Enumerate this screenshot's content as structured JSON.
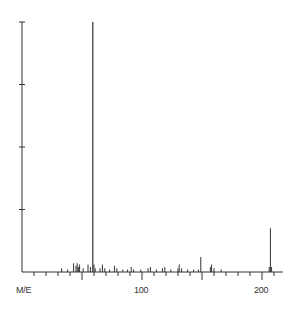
{
  "chart_data": {
    "type": "bar",
    "title": "",
    "xlabel": "M/E",
    "ylabel": "",
    "xlim": [
      0,
      215
    ],
    "ylim": [
      0,
      100
    ],
    "x_ticks": [
      100,
      200
    ],
    "x_tick_labels": [
      "100",
      "200"
    ],
    "y_ticks": [
      25,
      50,
      75,
      100
    ],
    "y_tick_labels": [],
    "grid": false,
    "legend": null,
    "peaks": [
      {
        "mz": 33,
        "intensity": 1.5
      },
      {
        "mz": 38,
        "intensity": 1.0
      },
      {
        "mz": 43,
        "intensity": 3.5
      },
      {
        "mz": 45,
        "intensity": 2.5
      },
      {
        "mz": 46,
        "intensity": 3.5
      },
      {
        "mz": 47,
        "intensity": 2.0
      },
      {
        "mz": 48,
        "intensity": 3.0
      },
      {
        "mz": 51,
        "intensity": 1.5
      },
      {
        "mz": 55,
        "intensity": 3.0
      },
      {
        "mz": 57,
        "intensity": 2.0
      },
      {
        "mz": 59,
        "intensity": 100.0
      },
      {
        "mz": 60,
        "intensity": 3.0
      },
      {
        "mz": 61,
        "intensity": 1.5
      },
      {
        "mz": 65,
        "intensity": 1.5
      },
      {
        "mz": 67,
        "intensity": 3.0
      },
      {
        "mz": 69,
        "intensity": 1.5
      },
      {
        "mz": 73,
        "intensity": 1.0
      },
      {
        "mz": 77,
        "intensity": 2.5
      },
      {
        "mz": 79,
        "intensity": 1.5
      },
      {
        "mz": 84,
        "intensity": 1.0
      },
      {
        "mz": 88,
        "intensity": 1.0
      },
      {
        "mz": 91,
        "intensity": 2.0
      },
      {
        "mz": 93,
        "intensity": 1.0
      },
      {
        "mz": 99,
        "intensity": 1.0
      },
      {
        "mz": 105,
        "intensity": 1.5
      },
      {
        "mz": 107,
        "intensity": 2.0
      },
      {
        "mz": 112,
        "intensity": 1.0
      },
      {
        "mz": 117,
        "intensity": 1.5
      },
      {
        "mz": 119,
        "intensity": 2.0
      },
      {
        "mz": 124,
        "intensity": 1.0
      },
      {
        "mz": 130,
        "intensity": 1.5
      },
      {
        "mz": 131,
        "intensity": 3.0
      },
      {
        "mz": 133,
        "intensity": 1.5
      },
      {
        "mz": 138,
        "intensity": 1.0
      },
      {
        "mz": 143,
        "intensity": 1.0
      },
      {
        "mz": 147,
        "intensity": 1.0
      },
      {
        "mz": 149,
        "intensity": 6.0
      },
      {
        "mz": 157,
        "intensity": 2.0
      },
      {
        "mz": 158,
        "intensity": 3.0
      },
      {
        "mz": 160,
        "intensity": 1.5
      },
      {
        "mz": 166,
        "intensity": 1.0
      },
      {
        "mz": 206,
        "intensity": 2.0
      },
      {
        "mz": 207,
        "intensity": 17.5
      },
      {
        "mz": 208,
        "intensity": 2.0
      }
    ]
  },
  "axis": {
    "xlabel": "M/E",
    "tick_100": "100",
    "tick_200": "200"
  },
  "colors": {
    "ink": "#333333",
    "background": "#ffffff"
  }
}
